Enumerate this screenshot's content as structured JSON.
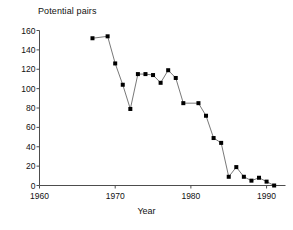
{
  "chart_data": {
    "type": "line",
    "title": "Potential pairs",
    "xlabel": "Year",
    "ylabel": "",
    "xlim": [
      1960,
      1992.5
    ],
    "ylim": [
      0,
      160
    ],
    "xticks": [
      1960,
      1970,
      1980,
      1990
    ],
    "xticklabels": [
      "1960",
      "1970",
      "1980",
      "1990"
    ],
    "yticks": [
      0,
      20,
      40,
      60,
      80,
      100,
      120,
      140,
      160
    ],
    "yticklabels": [
      "0",
      "20",
      "40",
      "60",
      "80",
      "100",
      "120",
      "140",
      "160"
    ],
    "grid": false,
    "legend": null,
    "marker": "square",
    "marker_color": "#000000",
    "line_color": "#555555",
    "axis_color": "#4d4d4d",
    "background": "#ffffff",
    "x": [
      1967,
      1969,
      1970,
      1971,
      1972,
      1973,
      1974,
      1975,
      1976,
      1977,
      1978,
      1979,
      1981,
      1982,
      1983,
      1984,
      1985,
      1986,
      1987,
      1988,
      1989,
      1990,
      1991
    ],
    "values": [
      152,
      154,
      126,
      104,
      79,
      115,
      115,
      114,
      106,
      119,
      111,
      85,
      85,
      72,
      49,
      44,
      9,
      19,
      9,
      5,
      8,
      4,
      0
    ],
    "series": [
      {
        "name": "Potential pairs",
        "x": [
          1967,
          1969,
          1970,
          1971,
          1972,
          1973,
          1974,
          1975,
          1976,
          1977,
          1978,
          1979,
          1981,
          1982,
          1983,
          1984,
          1985,
          1986,
          1987,
          1988,
          1989,
          1990,
          1991
        ],
        "values": [
          152,
          154,
          126,
          104,
          79,
          115,
          115,
          114,
          106,
          119,
          111,
          85,
          85,
          72,
          49,
          44,
          9,
          19,
          9,
          5,
          8,
          4,
          0
        ]
      }
    ]
  },
  "axis": {
    "title": "Potential pairs",
    "xlabel": "Year"
  }
}
